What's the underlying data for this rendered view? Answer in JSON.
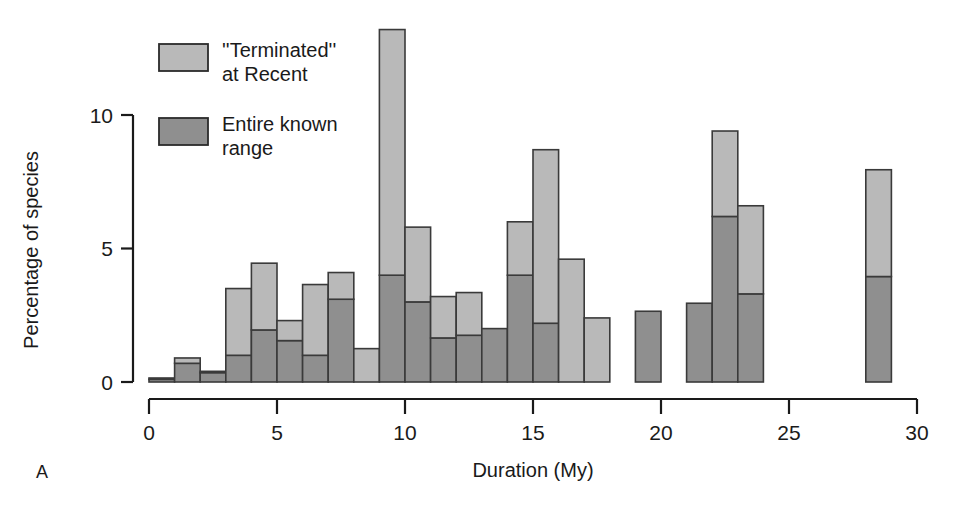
{
  "panel": {
    "label": "A"
  },
  "legend": {
    "position": "top-left-inside",
    "items": [
      {
        "label_line1": "''Terminated''",
        "label_line2": "at Recent",
        "color": "#b9b9b9",
        "key": "terminated-at-recent"
      },
      {
        "label_line1": "Entire known",
        "label_line2": "range",
        "color": "#8f8f8f",
        "key": "entire-known-range"
      }
    ]
  },
  "axes": {
    "x": {
      "label": "Duration (My)",
      "ticks": [
        0,
        5,
        10,
        15,
        20,
        25,
        30
      ],
      "tick_labels": [
        "0",
        "5",
        "10",
        "15",
        "20",
        "25",
        "30"
      ],
      "min": 0,
      "max": 30
    },
    "y": {
      "label": "Percentage of species",
      "ticks": [
        0,
        5,
        10
      ],
      "tick_labels": [
        "0",
        "5",
        "10"
      ],
      "min": 0,
      "max": 13.6
    }
  },
  "chart_data": {
    "type": "bar",
    "title": "",
    "subtitle": "",
    "xlabel": "Duration (My)",
    "ylabel": "Percentage of species",
    "xlim": [
      0,
      30
    ],
    "ylim": [
      0,
      13.6
    ],
    "grid": false,
    "stacked": true,
    "bin_width": 1,
    "legend_position": "inside-top-left",
    "categories": [
      "0-1",
      "1-2",
      "2-3",
      "3-4",
      "4-5",
      "5-6",
      "6-7",
      "7-8",
      "8-9",
      "9-10",
      "10-11",
      "11-12",
      "12-13",
      "13-14",
      "14-15",
      "15-16",
      "16-17",
      "17-18",
      "19-20",
      "21-22",
      "22-23",
      "23-24",
      "28-29"
    ],
    "bin_starts": [
      0,
      1,
      2,
      3,
      4,
      5,
      6,
      7,
      8,
      9,
      10,
      11,
      12,
      13,
      14,
      15,
      16,
      17,
      19,
      21,
      22,
      23,
      28
    ],
    "series": [
      {
        "name": "Entire known range",
        "color": "#8f8f8f",
        "values": [
          0.1,
          0.7,
          0.35,
          1.0,
          1.95,
          1.55,
          1.0,
          3.1,
          0.0,
          4.0,
          3.0,
          1.65,
          1.75,
          2.0,
          4.0,
          2.2,
          0.0,
          0.0,
          2.65,
          2.95,
          6.2,
          3.3,
          3.95
        ]
      },
      {
        "name": "''Terminated'' at Recent",
        "color": "#b9b9b9",
        "values": [
          0.05,
          0.2,
          0.05,
          2.5,
          2.5,
          0.75,
          2.65,
          1.0,
          1.25,
          9.2,
          2.8,
          1.55,
          1.6,
          0.0,
          2.0,
          6.5,
          4.6,
          2.4,
          0.0,
          0.0,
          3.2,
          3.3,
          4.0
        ]
      }
    ],
    "totals": [
      0.15,
      0.9,
      0.4,
      3.5,
      4.45,
      2.3,
      3.65,
      4.1,
      1.25,
      13.2,
      5.8,
      3.2,
      3.35,
      2.0,
      6.0,
      8.7,
      4.6,
      2.4,
      2.65,
      2.95,
      9.4,
      6.6,
      7.95
    ]
  }
}
